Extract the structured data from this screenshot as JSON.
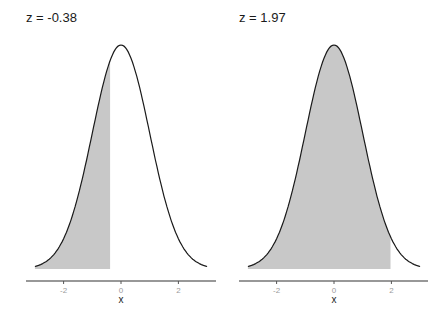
{
  "chart_data": [
    {
      "type": "area",
      "title": "z = -0.38",
      "xlabel": "x",
      "ylabel": "",
      "xlim": [
        -3.3,
        3.3
      ],
      "x_ticks": [
        -2,
        0,
        2
      ],
      "x_tick_labels": [
        "-2",
        "0",
        "2"
      ],
      "grid": false,
      "legend": null,
      "curve": "standard normal density",
      "mean": 0,
      "sd": 1,
      "shaded_region": {
        "from": -3.0,
        "to": -0.38,
        "side": "left",
        "color": "#c8c8c8"
      },
      "z": -0.38
    },
    {
      "type": "area",
      "title": "z = 1.97",
      "xlabel": "x",
      "ylabel": "",
      "xlim": [
        -3.3,
        3.3
      ],
      "x_ticks": [
        -2,
        0,
        2
      ],
      "x_tick_labels": [
        "-2",
        "0",
        "2"
      ],
      "grid": false,
      "legend": null,
      "curve": "standard normal density",
      "mean": 0,
      "sd": 1,
      "shaded_region": {
        "from": -3.0,
        "to": 1.97,
        "side": "left",
        "color": "#c8c8c8"
      },
      "z": 1.97
    }
  ],
  "panels": [
    {
      "title": "z = -0.38",
      "xlabel": "x",
      "ticks": [
        "-2",
        "0",
        "2"
      ]
    },
    {
      "title": "z = 1.97",
      "xlabel": "x",
      "ticks": [
        "-2",
        "0",
        "2"
      ]
    }
  ],
  "colors": {
    "fill": "#c8c8c8",
    "line": "#1a1a1a",
    "axis": "#333333",
    "tick_label": "#9a9a9a"
  }
}
